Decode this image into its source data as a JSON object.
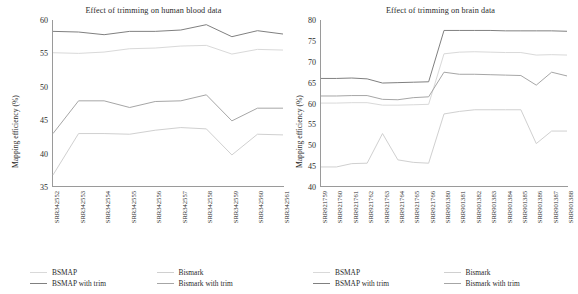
{
  "figure": {
    "panels": [
      "human-blood",
      "brain"
    ]
  },
  "colors": {
    "bsmap": "#d9d9d9",
    "bsmap_with_trim": "#808080",
    "bismark": "#d0d0d0",
    "bismark_with_trim": "#a6a6a6",
    "axis": "#9a9a9a",
    "text": "#2b2b2b"
  },
  "legend": {
    "entries": [
      {
        "label": "BSMAP",
        "color": "#d9d9d9"
      },
      {
        "label": "Bismark",
        "color": "#d0d0d0"
      },
      {
        "label": "BSMAP with trim",
        "color": "#808080"
      },
      {
        "label": "Bismark with trim",
        "color": "#a6a6a6"
      }
    ]
  },
  "chart_data": [
    {
      "type": "line",
      "id": "human-blood",
      "title": "Effect of trimming on human blood data",
      "xlabel": "",
      "ylabel": "Mapping efficiency (%)",
      "ylim": [
        35,
        60
      ],
      "yticks": [
        35,
        40,
        45,
        50,
        55,
        60
      ],
      "grid": false,
      "legend_position": "bottom",
      "categories": [
        "SRR342552",
        "SRR342553",
        "SRR342554",
        "SRR342555",
        "SRR342556",
        "SRR342557",
        "SRR342558",
        "SRR342559",
        "SRR342560",
        "SRR342561"
      ],
      "series": [
        {
          "name": "BSMAP",
          "color": "#d9d9d9",
          "values": [
            55.1,
            55.0,
            55.2,
            55.7,
            55.8,
            56.1,
            56.2,
            54.9,
            55.6,
            55.5
          ]
        },
        {
          "name": "Bismark",
          "color": "#d0d0d0",
          "values": [
            36.8,
            43.0,
            43.0,
            42.9,
            43.5,
            43.9,
            43.7,
            39.8,
            42.9,
            42.8
          ]
        },
        {
          "name": "BSMAP with trim",
          "color": "#808080",
          "values": [
            58.3,
            58.2,
            57.8,
            58.3,
            58.3,
            58.5,
            59.3,
            57.5,
            58.4,
            57.9
          ]
        },
        {
          "name": "Bismark with trim",
          "color": "#a6a6a6",
          "values": [
            43.0,
            47.9,
            47.9,
            46.9,
            47.8,
            47.9,
            48.8,
            44.9,
            46.8,
            46.8
          ]
        }
      ]
    },
    {
      "type": "line",
      "id": "brain",
      "title": "Effect of trimming on brain data",
      "xlabel": "",
      "ylabel": "Mapping efficiency (%)",
      "ylim": [
        40,
        80
      ],
      "yticks": [
        40,
        45,
        50,
        55,
        60,
        65,
        70,
        75,
        80
      ],
      "grid": false,
      "legend_position": "bottom",
      "categories": [
        "SRR921759",
        "SRR921760",
        "SRR921761",
        "SRR921762",
        "SRR921763",
        "SRR921764",
        "SRR921765",
        "SRR921766",
        "SRR901380",
        "SRR901381",
        "SRR901382",
        "SRR901383",
        "SRR901384",
        "SRR901385",
        "SRR901386",
        "SRR901387",
        "SRR901388"
      ],
      "series": [
        {
          "name": "BSMAP",
          "color": "#d9d9d9",
          "values": [
            60.1,
            60.1,
            60.2,
            60.2,
            59.6,
            59.6,
            59.7,
            59.8,
            71.9,
            72.3,
            72.4,
            72.3,
            72.2,
            72.2,
            71.6,
            71.7,
            71.6
          ]
        },
        {
          "name": "Bismark",
          "color": "#d0d0d0",
          "values": [
            44.8,
            44.8,
            45.6,
            45.7,
            52.8,
            46.5,
            45.9,
            45.7,
            57.5,
            58.1,
            58.5,
            58.5,
            58.5,
            58.5,
            50.4,
            53.4,
            53.4
          ]
        },
        {
          "name": "BSMAP with trim",
          "color": "#808080",
          "values": [
            66.0,
            66.0,
            66.1,
            65.9,
            64.9,
            65.0,
            65.1,
            65.2,
            77.5,
            77.5,
            77.5,
            77.5,
            77.4,
            77.4,
            77.4,
            77.4,
            77.3
          ]
        },
        {
          "name": "Bismark with trim",
          "color": "#a6a6a6",
          "values": [
            61.8,
            61.8,
            61.9,
            61.9,
            61.0,
            60.9,
            61.4,
            61.6,
            67.5,
            67.0,
            67.0,
            66.9,
            66.8,
            66.7,
            64.4,
            67.5,
            66.6
          ]
        }
      ]
    }
  ]
}
